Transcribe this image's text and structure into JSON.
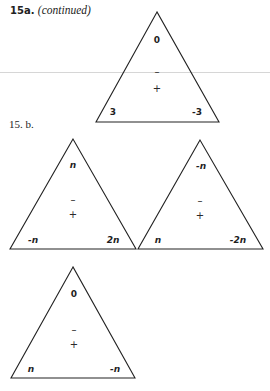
{
  "section_a": {
    "number": "15a.",
    "note": "(continued)"
  },
  "section_b": {
    "label": "15. b."
  },
  "triangles": [
    {
      "id": "15a-triangle",
      "top": "0",
      "bottom_left": "3",
      "bottom_right": "-3",
      "minus": "–",
      "plus": "+"
    },
    {
      "id": "15b-triangle-1",
      "top": "n",
      "bottom_left": "-n",
      "bottom_right": "2n",
      "minus": "–",
      "plus": "+"
    },
    {
      "id": "15b-triangle-2",
      "top": "-n",
      "bottom_left": "n",
      "bottom_right": "-2n",
      "minus": "–",
      "plus": "+"
    },
    {
      "id": "15b-triangle-3",
      "top": "0",
      "bottom_left": "n",
      "bottom_right": "-n",
      "minus": "–",
      "plus": "+"
    }
  ]
}
